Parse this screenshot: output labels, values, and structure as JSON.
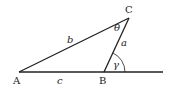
{
  "diagram": {
    "type": "triangle-exterior-angle",
    "vertices": {
      "A": "A",
      "B": "B",
      "C": "C"
    },
    "sides": {
      "a": "a",
      "b": "b",
      "c": "c"
    },
    "angles": {
      "theta": "θ",
      "gamma": "γ"
    },
    "colors": {
      "line": "#222222",
      "background": "#ffffff"
    }
  }
}
